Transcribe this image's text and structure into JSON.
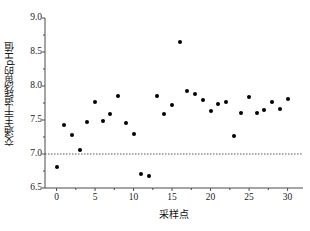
{
  "chart_data": {
    "type": "scatter",
    "title": "",
    "xlabel": "采样点",
    "ylabel": "交通主干道残留的pH值",
    "xlim": [
      -1.5,
      32
    ],
    "ylim": [
      6.5,
      9.0
    ],
    "xticks": [
      0,
      5,
      10,
      15,
      20,
      25,
      30
    ],
    "xtick_labels": [
      "0",
      "5",
      "10",
      "15",
      "20",
      "25",
      "30"
    ],
    "yticks": [
      6.5,
      7.0,
      7.5,
      8.0,
      8.5,
      9.0
    ],
    "ytick_labels": [
      "6.5",
      "7.0",
      "7.5",
      "8.0",
      "8.5",
      "9.0"
    ],
    "y_minor_tick_step": 0.25,
    "grid": false,
    "legend": null,
    "marker": "filled-circle",
    "marker_color": "#000000",
    "reference_line": {
      "name": "neutral-ph-line",
      "y": 7.0,
      "style": "dotted",
      "color": "#555555"
    },
    "x": [
      0,
      1,
      2,
      3,
      4,
      5,
      6,
      7,
      8,
      9,
      10,
      11,
      12,
      13,
      14,
      15,
      16,
      17,
      18,
      19,
      20,
      21,
      22,
      23,
      24,
      25,
      26,
      27,
      28,
      29,
      30
    ],
    "values": [
      6.81,
      7.42,
      7.28,
      7.06,
      7.47,
      7.77,
      7.48,
      7.59,
      7.85,
      7.45,
      7.29,
      6.71,
      6.67,
      7.85,
      7.59,
      7.72,
      8.65,
      7.92,
      7.88,
      7.8,
      7.63,
      7.74,
      7.76,
      7.26,
      7.6,
      7.84,
      7.6,
      7.64,
      7.76,
      7.66,
      7.81
    ]
  }
}
